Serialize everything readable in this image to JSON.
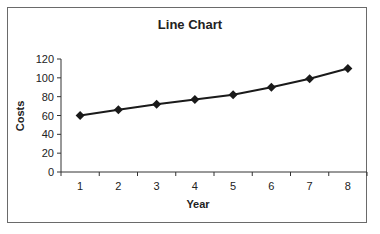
{
  "chart_data": {
    "type": "line",
    "title": "Line Chart",
    "xlabel": "Year",
    "ylabel": "Costs",
    "categories": [
      "1",
      "2",
      "3",
      "4",
      "5",
      "6",
      "7",
      "8"
    ],
    "series": [
      {
        "name": "Costs",
        "values": [
          60,
          66,
          72,
          77,
          82,
          90,
          99,
          110
        ],
        "marker": "diamond",
        "color": "#1a1a1a"
      }
    ],
    "ylim": [
      0,
      120
    ],
    "yticks": [
      0,
      20,
      40,
      60,
      80,
      100,
      120
    ],
    "grid": false,
    "legend": "none"
  },
  "colors": {
    "line": "#1a1a1a",
    "axis": "#333333",
    "frame": "#6a6a6a"
  }
}
